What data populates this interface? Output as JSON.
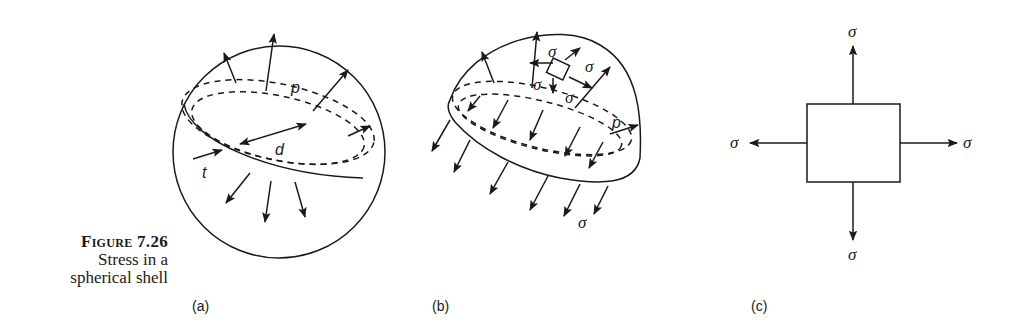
{
  "figure": {
    "number": "Figure 7.26",
    "caption_line1": "Stress in a",
    "caption_line2": "spherical shell"
  },
  "panels": [
    {
      "id": "a",
      "label": "(a)",
      "description": "Sphere under internal pressure p, diameter d, wall thickness t",
      "symbols": [
        "p",
        "d",
        "t"
      ]
    },
    {
      "id": "b",
      "label": "(b)",
      "description": "Hemisphere free body with membrane stress sigma and pressure p",
      "symbols": [
        "σ",
        "σ",
        "σ",
        "σ",
        "p",
        "σ"
      ]
    },
    {
      "id": "c",
      "label": "(c)",
      "description": "Element under equal biaxial stress sigma",
      "symbols": [
        "σ",
        "σ",
        "σ",
        "σ"
      ]
    }
  ],
  "symbols": {
    "pressure": "p",
    "diameter": "d",
    "thickness": "t",
    "stress": "σ"
  }
}
